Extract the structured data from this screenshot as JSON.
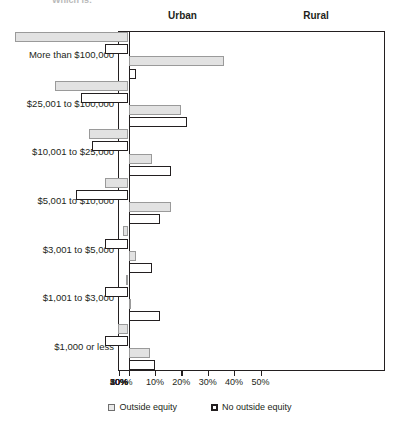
{
  "clipped_title": "Which is:",
  "panels": {
    "left_label": "Urban",
    "right_label": "Rural"
  },
  "legend": {
    "items": [
      {
        "label": "Outside equity",
        "key": "outside",
        "fill": "#e2e2e2",
        "stroke": "#9a9a9a"
      },
      {
        "label": "No outside equity",
        "key": "nooutside",
        "fill": "#ffffff",
        "stroke": "#231f20"
      }
    ]
  },
  "axis": {
    "tick_labels": [
      "50%",
      "40%",
      "30%",
      "20%",
      "10%",
      "%",
      "10%",
      "20%",
      "30%",
      "40%",
      "50%"
    ],
    "tick_values": [
      -50,
      -40,
      -30,
      -20,
      -10,
      0,
      10,
      20,
      30,
      40,
      50
    ],
    "min": -50,
    "max": 50
  },
  "chart_data": {
    "type": "bar",
    "orientation": "horizontal",
    "layout": "diverging-paired-panels",
    "title": "Which is:",
    "xlabel": "",
    "ylabel": "",
    "xlim": [
      -50,
      50
    ],
    "grid": false,
    "legend_position": "bottom-center",
    "panel_left": "Urban",
    "panel_right": "Rural",
    "note": "Left panel (Urban) bars extend leftward from the centre axis; right panel (Rural) bars extend rightward. Values are percentages.",
    "categories": [
      "More than $100,000",
      "$25,001 to $100,000",
      "$10,001 to $25,000",
      "$5,001 to $10,000",
      "$3,001 to $5,000",
      "$1,001 to $3,000",
      "$1,000 or less"
    ],
    "series": [
      {
        "name": "Urban - Outside equity",
        "panel": "Urban",
        "key": "outside",
        "direction": "left",
        "values": [
          43,
          28,
          15,
          9,
          2,
          1,
          4
        ]
      },
      {
        "name": "Urban - No outside equity",
        "panel": "Urban",
        "key": "nooutside",
        "direction": "left",
        "values": [
          9,
          18,
          14,
          20,
          9,
          9,
          9
        ]
      },
      {
        "name": "Rural - Outside equity",
        "panel": "Rural",
        "key": "outside",
        "direction": "right",
        "values": [
          36,
          20,
          9,
          16,
          3,
          1,
          8
        ]
      },
      {
        "name": "Rural - No outside equity",
        "panel": "Rural",
        "key": "nooutside",
        "direction": "right",
        "values": [
          3,
          22,
          16,
          12,
          9,
          12,
          10
        ]
      }
    ]
  }
}
